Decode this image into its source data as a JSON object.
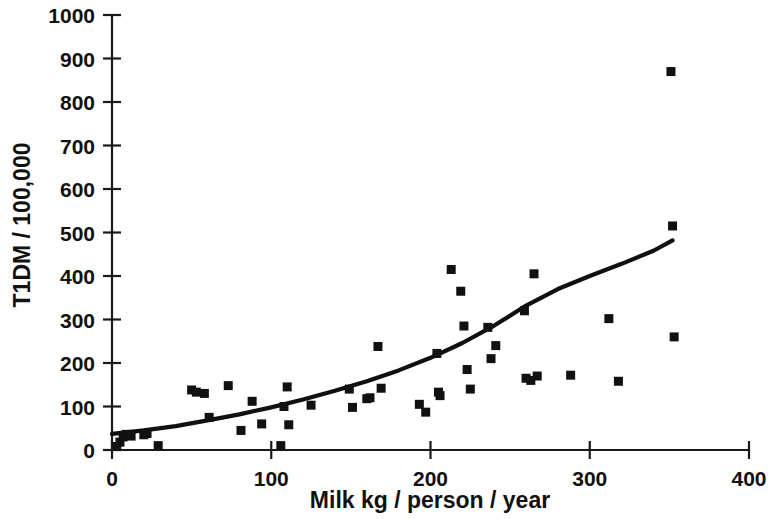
{
  "chart_data": {
    "type": "scatter",
    "title": "",
    "xlabel": "Milk kg / person / year",
    "ylabel": "T1DM / 100,000",
    "xlim": [
      0,
      400
    ],
    "ylim": [
      0,
      1000
    ],
    "xticks": [
      0,
      100,
      200,
      300,
      400
    ],
    "yticks": [
      0,
      100,
      200,
      300,
      400,
      500,
      600,
      700,
      800,
      900,
      1000
    ],
    "xtick_labels": [
      "0",
      "100",
      "200",
      "300",
      "400"
    ],
    "ytick_labels": [
      "0",
      "100",
      "200",
      "300",
      "400",
      "500",
      "600",
      "700",
      "800",
      "900",
      "1000"
    ],
    "grid": false,
    "legend": false,
    "legend_position": "none",
    "marker": "square",
    "marker_color": "#111111",
    "series": [
      {
        "name": "Countries",
        "type": "scatter",
        "points": [
          {
            "x": 3,
            "y": 8
          },
          {
            "x": 5,
            "y": 18
          },
          {
            "x": 7,
            "y": 30
          },
          {
            "x": 9,
            "y": 36
          },
          {
            "x": 12,
            "y": 32
          },
          {
            "x": 20,
            "y": 35
          },
          {
            "x": 22,
            "y": 38
          },
          {
            "x": 29,
            "y": 10
          },
          {
            "x": 50,
            "y": 138
          },
          {
            "x": 53,
            "y": 133
          },
          {
            "x": 58,
            "y": 130
          },
          {
            "x": 61,
            "y": 75
          },
          {
            "x": 73,
            "y": 148
          },
          {
            "x": 81,
            "y": 45
          },
          {
            "x": 88,
            "y": 112
          },
          {
            "x": 94,
            "y": 60
          },
          {
            "x": 106,
            "y": 10
          },
          {
            "x": 108,
            "y": 100
          },
          {
            "x": 110,
            "y": 145
          },
          {
            "x": 111,
            "y": 58
          },
          {
            "x": 125,
            "y": 103
          },
          {
            "x": 149,
            "y": 140
          },
          {
            "x": 151,
            "y": 98
          },
          {
            "x": 160,
            "y": 118
          },
          {
            "x": 162,
            "y": 120
          },
          {
            "x": 167,
            "y": 238
          },
          {
            "x": 169,
            "y": 142
          },
          {
            "x": 193,
            "y": 105
          },
          {
            "x": 197,
            "y": 87
          },
          {
            "x": 204,
            "y": 222
          },
          {
            "x": 205,
            "y": 133
          },
          {
            "x": 206,
            "y": 125
          },
          {
            "x": 213,
            "y": 415
          },
          {
            "x": 219,
            "y": 365
          },
          {
            "x": 221,
            "y": 285
          },
          {
            "x": 223,
            "y": 185
          },
          {
            "x": 225,
            "y": 140
          },
          {
            "x": 236,
            "y": 282
          },
          {
            "x": 238,
            "y": 210
          },
          {
            "x": 241,
            "y": 240
          },
          {
            "x": 259,
            "y": 320
          },
          {
            "x": 260,
            "y": 165
          },
          {
            "x": 263,
            "y": 160
          },
          {
            "x": 265,
            "y": 405
          },
          {
            "x": 267,
            "y": 170
          },
          {
            "x": 288,
            "y": 172
          },
          {
            "x": 312,
            "y": 302
          },
          {
            "x": 318,
            "y": 158
          },
          {
            "x": 351,
            "y": 870
          },
          {
            "x": 352,
            "y": 515
          },
          {
            "x": 353,
            "y": 260
          }
        ]
      },
      {
        "name": "Fitted exponential trend",
        "type": "line",
        "points": [
          {
            "x": 0,
            "y": 37
          },
          {
            "x": 20,
            "y": 45
          },
          {
            "x": 40,
            "y": 55
          },
          {
            "x": 60,
            "y": 68
          },
          {
            "x": 80,
            "y": 82
          },
          {
            "x": 100,
            "y": 98
          },
          {
            "x": 120,
            "y": 116
          },
          {
            "x": 140,
            "y": 136
          },
          {
            "x": 160,
            "y": 158
          },
          {
            "x": 180,
            "y": 183
          },
          {
            "x": 200,
            "y": 212
          },
          {
            "x": 220,
            "y": 246
          },
          {
            "x": 240,
            "y": 286
          },
          {
            "x": 260,
            "y": 332
          },
          {
            "x": 280,
            "y": 370
          },
          {
            "x": 300,
            "y": 400
          },
          {
            "x": 320,
            "y": 428
          },
          {
            "x": 340,
            "y": 458
          },
          {
            "x": 352,
            "y": 482
          }
        ]
      }
    ]
  }
}
